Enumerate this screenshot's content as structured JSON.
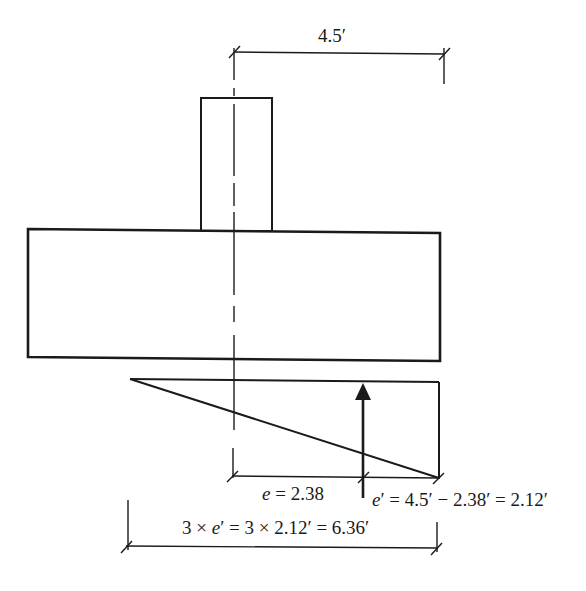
{
  "diagram": {
    "dimensions": {
      "top": {
        "label": "4.5′",
        "value_ft": 4.5
      },
      "eccentricity": {
        "label": "e = 2.38",
        "symbol": "e",
        "value": 2.38
      },
      "e_prime": {
        "label": "e′ = 4.5′ − 2.38′ = 2.12′",
        "symbol": "e′",
        "value_ft": 2.12
      },
      "pressure_length": {
        "label": "3 × e′ = 3 × 2.12′ = 6.36′",
        "value_ft": 6.36
      }
    },
    "elements": {
      "column": "column",
      "footing": "footing",
      "centerline": "column centerline",
      "pressure": "triangular soil pressure diagram",
      "resultant": "resultant force arrow"
    },
    "colors": {
      "line": "#1a1a1a",
      "background": "#ffffff"
    }
  }
}
